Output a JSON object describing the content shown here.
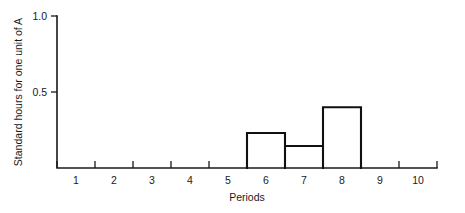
{
  "chart_data": {
    "type": "bar",
    "title": "",
    "subtitle": "",
    "xlabel": "Periods",
    "ylabel": "Standard hours for one unit of A",
    "categories": [
      "1",
      "2",
      "3",
      "4",
      "5",
      "6",
      "7",
      "8",
      "9",
      "10"
    ],
    "values": [
      0,
      0,
      0,
      0,
      0,
      0.23,
      0.145,
      0.4,
      0,
      0
    ],
    "xlim": [
      0.5,
      10.5
    ],
    "ylim": [
      0,
      1.0
    ],
    "x_tick_labels": [
      "1",
      "2",
      "3",
      "4",
      "5",
      "6",
      "7",
      "8",
      "9",
      "10"
    ],
    "y_tick_labels": [
      "0.5",
      "1.0"
    ],
    "y_tick_values": [
      0.5,
      1.0
    ],
    "grid": false,
    "legend": null,
    "legend_position": "none",
    "bar_style": "outlined-unfilled-histogram",
    "bar_edge_color": "#111111",
    "bar_fill_color": "#ffffff",
    "axis_color": "#1a1a1a",
    "background_color": "#ffffff",
    "annotations": []
  },
  "axes": {
    "y_title": "Standard hours for one unit of A",
    "x_title": "Periods"
  }
}
